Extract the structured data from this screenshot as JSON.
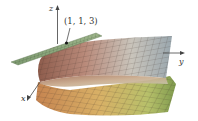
{
  "figure": {
    "point_label": "(1, 1, 3)",
    "axes": {
      "x_label": "x",
      "y_label": "y",
      "z_label": "z"
    },
    "colors": {
      "tangent_plane": "#8fa77c",
      "surface_upper_left": "#a0705e",
      "surface_upper_right": "#b8c0c4",
      "surface_lower_left": "#d29a5e",
      "surface_lower_right": "#a6b862",
      "grid_line": "#3a2e28",
      "axis": "#444444"
    }
  }
}
